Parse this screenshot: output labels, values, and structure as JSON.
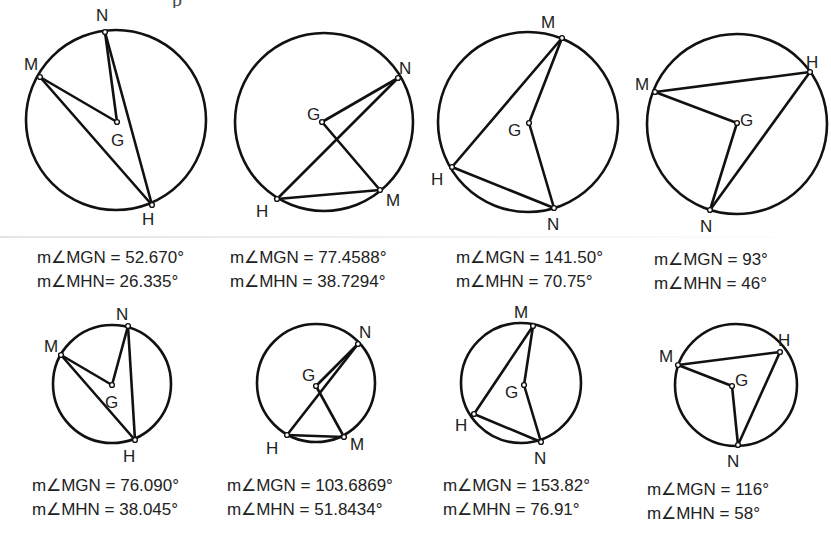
{
  "page": {
    "top_text_clipped": "p",
    "figures": [
      {
        "id": "fig-1",
        "circle": {
          "cx": 116,
          "cy": 120,
          "r": 90
        },
        "points": {
          "N": {
            "x": 105,
            "y": 32,
            "lx": 96,
            "ly": 21
          },
          "M": {
            "x": 40,
            "y": 77,
            "lx": 24,
            "ly": 70
          },
          "G": {
            "x": 117,
            "y": 122,
            "lx": 111,
            "ly": 146
          },
          "H": {
            "x": 152,
            "y": 205,
            "lx": 142,
            "ly": 225
          }
        },
        "labels": {
          "N": "N",
          "M": "M",
          "G": "G",
          "H": "H"
        },
        "caption": {
          "x": 37,
          "y": 246,
          "mgn": "m∠MGN = 52.670°",
          "mhn": "m∠MHN= 26.335°"
        }
      },
      {
        "id": "fig-2",
        "circle": {
          "cx": 324,
          "cy": 122,
          "r": 89
        },
        "points": {
          "N": {
            "x": 398,
            "y": 78,
            "lx": 399,
            "ly": 74
          },
          "M": {
            "x": 380,
            "y": 190,
            "lx": 386,
            "ly": 206
          },
          "G": {
            "x": 322,
            "y": 122,
            "lx": 307,
            "ly": 120
          },
          "H": {
            "x": 277,
            "y": 199,
            "lx": 256,
            "ly": 217
          }
        },
        "labels": {
          "N": "N",
          "M": "M",
          "G": "G",
          "H": "H"
        },
        "caption": {
          "x": 230,
          "y": 246,
          "mgn": "m∠MGN = 77.4588°",
          "mhn": "m∠MHN = 38.7294°"
        }
      },
      {
        "id": "fig-3",
        "circle": {
          "cx": 528,
          "cy": 122,
          "r": 90
        },
        "points": {
          "M": {
            "x": 562,
            "y": 38,
            "lx": 541,
            "ly": 28
          },
          "G": {
            "x": 529,
            "y": 123,
            "lx": 508,
            "ly": 136
          },
          "H": {
            "x": 452,
            "y": 167,
            "lx": 431,
            "ly": 185
          },
          "N": {
            "x": 554,
            "y": 208,
            "lx": 547,
            "ly": 230
          }
        },
        "labels": {
          "N": "N",
          "M": "M",
          "G": "G",
          "H": "H"
        },
        "caption": {
          "x": 456,
          "y": 246,
          "mgn": "m∠MGN = 141.50°",
          "mhn": "m∠MHN = 70.75°"
        }
      },
      {
        "id": "fig-4",
        "circle": {
          "cx": 737,
          "cy": 124,
          "r": 90
        },
        "points": {
          "M": {
            "x": 655,
            "y": 92,
            "lx": 635,
            "ly": 90
          },
          "H": {
            "x": 810,
            "y": 72,
            "lx": 806,
            "ly": 68
          },
          "G": {
            "x": 737,
            "y": 123,
            "lx": 740,
            "ly": 126
          },
          "N": {
            "x": 710,
            "y": 210,
            "lx": 700,
            "ly": 232
          }
        },
        "labels": {
          "N": "N",
          "M": "M",
          "G": "G",
          "H": "H"
        },
        "caption": {
          "x": 654,
          "y": 248,
          "mgn": "m∠MGN = 93°",
          "mhn": "m∠MHN = 46°"
        }
      },
      {
        "id": "fig-5",
        "circle": {
          "cx": 112,
          "cy": 384,
          "r": 59
        },
        "points": {
          "N": {
            "x": 128,
            "y": 326,
            "lx": 116,
            "ly": 320
          },
          "M": {
            "x": 61,
            "y": 355,
            "lx": 44,
            "ly": 352
          },
          "G": {
            "x": 112,
            "y": 385,
            "lx": 105,
            "ly": 408
          },
          "H": {
            "x": 135,
            "y": 440,
            "lx": 123,
            "ly": 462
          }
        },
        "labels": {
          "N": "N",
          "M": "M",
          "G": "G",
          "H": "H"
        },
        "caption": {
          "x": 32,
          "y": 474,
          "mgn": "m∠MGN = 76.090°",
          "mhn": "m∠MHN = 38.045°"
        }
      },
      {
        "id": "fig-6",
        "circle": {
          "cx": 316,
          "cy": 383,
          "r": 59
        },
        "points": {
          "N": {
            "x": 358,
            "y": 344,
            "lx": 359,
            "ly": 338
          },
          "G": {
            "x": 316,
            "y": 386,
            "lx": 302,
            "ly": 381
          },
          "M": {
            "x": 344,
            "y": 437,
            "lx": 350,
            "ly": 450
          },
          "H": {
            "x": 287,
            "y": 435,
            "lx": 266,
            "ly": 454
          }
        },
        "labels": {
          "N": "N",
          "M": "M",
          "G": "G",
          "H": "H"
        },
        "caption": {
          "x": 227,
          "y": 474,
          "mgn": "m∠MGN = 103.6869°",
          "mhn": "m∠MHN = 51.8434°"
        }
      },
      {
        "id": "fig-7",
        "circle": {
          "cx": 521,
          "cy": 383,
          "r": 60
        },
        "points": {
          "M": {
            "x": 533,
            "y": 326,
            "lx": 514,
            "ly": 318
          },
          "G": {
            "x": 524,
            "y": 385,
            "lx": 505,
            "ly": 398
          },
          "H": {
            "x": 474,
            "y": 414,
            "lx": 455,
            "ly": 431
          },
          "N": {
            "x": 541,
            "y": 442,
            "lx": 534,
            "ly": 464
          }
        },
        "labels": {
          "N": "N",
          "M": "M",
          "G": "G",
          "H": "H"
        },
        "caption": {
          "x": 443,
          "y": 474,
          "mgn": "m∠MGN = 153.82°",
          "mhn": "m∠MHN = 76.91°"
        }
      },
      {
        "id": "fig-8",
        "circle": {
          "cx": 736,
          "cy": 385,
          "r": 61
        },
        "points": {
          "M": {
            "x": 678,
            "y": 365,
            "lx": 659,
            "ly": 362
          },
          "H": {
            "x": 780,
            "y": 352,
            "lx": 778,
            "ly": 346
          },
          "G": {
            "x": 732,
            "y": 386,
            "lx": 735,
            "ly": 386
          },
          "N": {
            "x": 738,
            "y": 445,
            "lx": 727,
            "ly": 467
          }
        },
        "labels": {
          "N": "N",
          "M": "M",
          "G": "G",
          "H": "H"
        },
        "caption": {
          "x": 647,
          "y": 478,
          "mgn": "m∠MGN = 116°",
          "mhn": "m∠MHN = 58°"
        }
      }
    ]
  }
}
